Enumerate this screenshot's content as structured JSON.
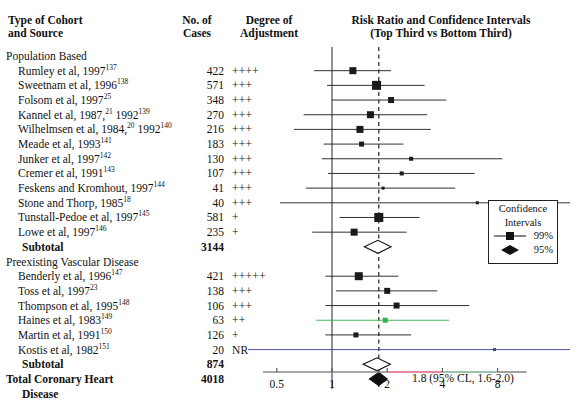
{
  "header": {
    "cohort": "Type of Cohort\nand Source",
    "cohort_line1": "Type of Cohort",
    "cohort_line2": "and Source",
    "cases_line1": "No. of",
    "cases_line2": "Cases",
    "adjust_line1": "Degree of",
    "adjust_line2": "Adjustment",
    "plot_line1": "Risk Ratio and Confidence Intervals",
    "plot_line2": "(Top Third vs Bottom Third)"
  },
  "groups": [
    {
      "name": "Population Based",
      "label": "Population Based",
      "studies": [
        {
          "label": "Rumley et al, 1997",
          "ref": "137",
          "cases": "422",
          "adjustment": "++++",
          "rr": 1.3,
          "lo": 0.8,
          "hi": 2.1,
          "size": 7,
          "color": "#1a1a1a"
        },
        {
          "label": "Sweetnam et al, 1996",
          "ref": "138",
          "cases": "571",
          "adjustment": "+++",
          "rr": 1.75,
          "lo": 0.94,
          "hi": 3.2,
          "size": 9,
          "color": "#1a1a1a"
        },
        {
          "label": "Folsom et al, 1997",
          "ref": "25",
          "cases": "348",
          "adjustment": "+++",
          "rr": 2.1,
          "lo": 1.0,
          "hi": 4.2,
          "size": 6,
          "color": "#1a1a1a"
        },
        {
          "label": "Kannel et al, 1987,",
          "ref": "21",
          "label2": " 1992",
          "ref2": "139",
          "cases": "270",
          "adjustment": "+++",
          "rr": 1.62,
          "lo": 0.7,
          "hi": 3.3,
          "size": 7,
          "color": "#1a1a1a"
        },
        {
          "label": "Wilhelmsen et al, 1984,",
          "ref": "20",
          "label2": " 1992",
          "ref2": "140",
          "cases": "216",
          "adjustment": "+++",
          "rr": 1.42,
          "lo": 0.62,
          "hi": 3.45,
          "size": 7,
          "color": "#1a1a1a"
        },
        {
          "label": "Meade et al, 1993",
          "ref": "141",
          "cases": "183",
          "adjustment": "+++",
          "rr": 1.45,
          "lo": 0.9,
          "hi": 2.45,
          "size": 5,
          "color": "#1a1a1a"
        },
        {
          "label": "Junker et al, 1997",
          "ref": "142",
          "cases": "130",
          "adjustment": "+++",
          "rr": 2.7,
          "lo": 0.88,
          "hi": 8.5,
          "size": 4,
          "color": "#1a1a1a"
        },
        {
          "label": "Cremer et al, 1991",
          "ref": "143",
          "cases": "107",
          "adjustment": "+++",
          "rr": 2.4,
          "lo": 0.95,
          "hi": 6.0,
          "size": 4,
          "color": "#1a1a1a"
        },
        {
          "label": "Feskens and Kromhout, 1997",
          "ref": "144",
          "cases": "41",
          "adjustment": "+++",
          "rr": 1.9,
          "lo": 0.72,
          "hi": 4.7,
          "size": 3,
          "color": "#1a1a1a"
        },
        {
          "label": "Stone and Thorp, 1985",
          "ref": "18",
          "cases": "40",
          "adjustment": "+++",
          "rr": 6.2,
          "lo": 0.52,
          "hi": 30.0,
          "size": 3,
          "color": "#1a1a1a"
        },
        {
          "label": "Tunstall-Pedoe et al, 1997",
          "ref": "145",
          "cases": "581",
          "adjustment": "+",
          "rr": 1.8,
          "lo": 1.1,
          "hi": 3.0,
          "size": 9,
          "color": "#1a1a1a"
        },
        {
          "label": "Lowe et al, 1997",
          "ref": "146",
          "cases": "235",
          "adjustment": "+",
          "rr": 1.32,
          "lo": 0.78,
          "hi": 2.55,
          "size": 7,
          "color": "#1a1a1a"
        }
      ],
      "subtotal": {
        "label": "Subtotal",
        "cases": "3144",
        "rr": 1.78,
        "lo": 1.5,
        "hi": 2.1
      }
    },
    {
      "name": "Preexisting Vascular Disease",
      "label": "Preexisting Vascular Disease",
      "studies": [
        {
          "label": "Benderly et al, 1996",
          "ref": "147",
          "cases": "421",
          "adjustment": "+++++",
          "rr": 1.4,
          "lo": 0.92,
          "hi": 2.3,
          "size": 8,
          "color": "#1a1a1a"
        },
        {
          "label": "Toss et al, 1997",
          "ref": "23",
          "cases": "138",
          "adjustment": "+++",
          "rr": 2.0,
          "lo": 1.05,
          "hi": 3.75,
          "size": 6,
          "color": "#1a1a1a"
        },
        {
          "label": "Thompson et al, 1995",
          "ref": "148",
          "cases": "106",
          "adjustment": "+++",
          "rr": 2.25,
          "lo": 0.92,
          "hi": 5.6,
          "size": 6,
          "color": "#1a1a1a"
        },
        {
          "label": "Haines et al, 1983",
          "ref": "149",
          "cases": "63",
          "adjustment": "++",
          "rr": 1.95,
          "lo": 0.82,
          "hi": 4.35,
          "size": 5,
          "color": "#2db34a"
        },
        {
          "label": "Martin et al, 1991",
          "ref": "150",
          "cases": "126",
          "adjustment": "+",
          "rr": 1.35,
          "lo": 0.92,
          "hi": 2.7,
          "size": 5,
          "color": "#1a1a1a"
        },
        {
          "label": "Kostis et al, 1982",
          "ref": "151",
          "cases": "20",
          "adjustment": "NR",
          "rr": 7.7,
          "lo": 0.33,
          "hi": 34.0,
          "size": 3,
          "color": "#3b3f8f"
        }
      ],
      "subtotal": {
        "label": "Subtotal",
        "cases": "874",
        "rr": 1.76,
        "lo": 1.48,
        "hi": 2.08
      }
    }
  ],
  "total": {
    "label_line1": "Total Coronary Heart",
    "label_line2": "Disease",
    "cases": "4018",
    "rr": 1.8,
    "lo": 1.6,
    "hi": 2.0,
    "annotation": "1.8 (95% CL, 1.6-2.0)"
  },
  "axis": {
    "ticks": [
      "0.5",
      "1",
      "2",
      "4",
      "8"
    ],
    "tick_values": [
      0.5,
      1,
      2,
      4,
      8
    ],
    "reference_line": 1,
    "dashed_line": 1.8,
    "scale": "log"
  },
  "legend": {
    "title_line1": "Confidence",
    "title_line2": "Intervals",
    "items": [
      {
        "label": "99%",
        "marker": "square"
      },
      {
        "label": "95%",
        "marker": "diamond"
      }
    ]
  },
  "chart_data": {
    "type": "forest",
    "title": "Risk Ratio and Confidence Intervals (Top Third vs Bottom Third)",
    "xlabel": "",
    "xscale": "log",
    "xticks": [
      0.5,
      1,
      2,
      4,
      8
    ],
    "xlim": [
      0.38,
      12
    ],
    "reference_line": 1,
    "dashed_line": 1.8,
    "rows": [
      {
        "study": "Rumley et al, 1997",
        "cases": 422,
        "adjustment": "++++",
        "rr": 1.3,
        "ci_low": 0.8,
        "ci_high": 2.1,
        "group": "Population Based"
      },
      {
        "study": "Sweetnam et al, 1996",
        "cases": 571,
        "adjustment": "+++",
        "rr": 1.75,
        "ci_low": 0.94,
        "ci_high": 3.2,
        "group": "Population Based"
      },
      {
        "study": "Folsom et al, 1997",
        "cases": 348,
        "adjustment": "+++",
        "rr": 2.1,
        "ci_low": 1.0,
        "ci_high": 4.2,
        "group": "Population Based"
      },
      {
        "study": "Kannel et al, 1987, 1992",
        "cases": 270,
        "adjustment": "+++",
        "rr": 1.62,
        "ci_low": 0.7,
        "ci_high": 3.3,
        "group": "Population Based"
      },
      {
        "study": "Wilhelmsen et al, 1984, 1992",
        "cases": 216,
        "adjustment": "+++",
        "rr": 1.42,
        "ci_low": 0.62,
        "ci_high": 3.45,
        "group": "Population Based"
      },
      {
        "study": "Meade et al, 1993",
        "cases": 183,
        "adjustment": "+++",
        "rr": 1.45,
        "ci_low": 0.9,
        "ci_high": 2.45,
        "group": "Population Based"
      },
      {
        "study": "Junker et al, 1997",
        "cases": 130,
        "adjustment": "+++",
        "rr": 2.7,
        "ci_low": 0.88,
        "ci_high": 8.5,
        "group": "Population Based"
      },
      {
        "study": "Cremer et al, 1991",
        "cases": 107,
        "adjustment": "+++",
        "rr": 2.4,
        "ci_low": 0.95,
        "ci_high": 6.0,
        "group": "Population Based"
      },
      {
        "study": "Feskens and Kromhout, 1997",
        "cases": 41,
        "adjustment": "+++",
        "rr": 1.9,
        "ci_low": 0.72,
        "ci_high": 4.7,
        "group": "Population Based"
      },
      {
        "study": "Stone and Thorp, 1985",
        "cases": 40,
        "adjustment": "+++",
        "rr": 6.2,
        "ci_low": 0.52,
        "ci_high": 30.0,
        "group": "Population Based"
      },
      {
        "study": "Tunstall-Pedoe et al, 1997",
        "cases": 581,
        "adjustment": "+",
        "rr": 1.8,
        "ci_low": 1.1,
        "ci_high": 3.0,
        "group": "Population Based"
      },
      {
        "study": "Lowe et al, 1997",
        "cases": 235,
        "adjustment": "+",
        "rr": 1.32,
        "ci_low": 0.78,
        "ci_high": 2.55,
        "group": "Population Based"
      },
      {
        "study": "Subtotal",
        "cases": 3144,
        "rr": 1.78,
        "ci_low": 1.5,
        "ci_high": 2.1,
        "type": "summary",
        "group": "Population Based"
      },
      {
        "study": "Benderly et al, 1996",
        "cases": 421,
        "adjustment": "+++++",
        "rr": 1.4,
        "ci_low": 0.92,
        "ci_high": 2.3,
        "group": "Preexisting Vascular Disease"
      },
      {
        "study": "Toss et al, 1997",
        "cases": 138,
        "adjustment": "+++",
        "rr": 2.0,
        "ci_low": 1.05,
        "ci_high": 3.75,
        "group": "Preexisting Vascular Disease"
      },
      {
        "study": "Thompson et al, 1995",
        "cases": 106,
        "adjustment": "+++",
        "rr": 2.25,
        "ci_low": 0.92,
        "ci_high": 5.6,
        "group": "Preexisting Vascular Disease"
      },
      {
        "study": "Haines et al, 1983",
        "cases": 63,
        "adjustment": "++",
        "rr": 1.95,
        "ci_low": 0.82,
        "ci_high": 4.35,
        "group": "Preexisting Vascular Disease"
      },
      {
        "study": "Martin et al, 1991",
        "cases": 126,
        "adjustment": "+",
        "rr": 1.35,
        "ci_low": 0.92,
        "ci_high": 2.7,
        "group": "Preexisting Vascular Disease"
      },
      {
        "study": "Kostis et al, 1982",
        "cases": 20,
        "adjustment": "NR",
        "rr": 7.7,
        "ci_low": 0.33,
        "ci_high": 34.0,
        "group": "Preexisting Vascular Disease"
      },
      {
        "study": "Subtotal",
        "cases": 874,
        "rr": 1.76,
        "ci_low": 1.48,
        "ci_high": 2.08,
        "type": "summary",
        "group": "Preexisting Vascular Disease"
      },
      {
        "study": "Total Coronary Heart Disease",
        "cases": 4018,
        "rr": 1.8,
        "ci_low": 1.6,
        "ci_high": 2.0,
        "type": "total"
      }
    ]
  }
}
